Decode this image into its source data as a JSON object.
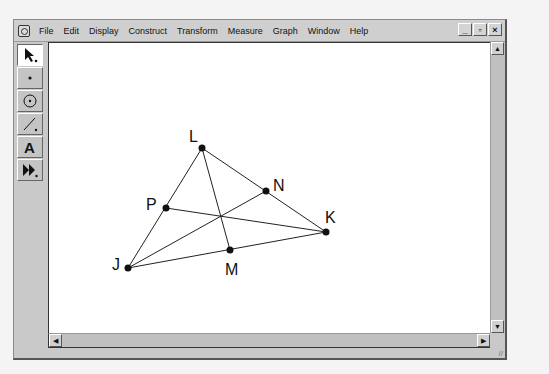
{
  "window": {
    "menu": [
      "File",
      "Edit",
      "Display",
      "Construct",
      "Transform",
      "Measure",
      "Graph",
      "Window",
      "Help"
    ],
    "controls": {
      "minimize": "_",
      "restore": "▫",
      "close": "×"
    }
  },
  "toolbox": {
    "tools": [
      {
        "name": "selection-arrow-tool",
        "glyph": "↖",
        "active": true
      },
      {
        "name": "point-tool",
        "glyph": "•",
        "active": false
      },
      {
        "name": "compass-tool",
        "glyph": "⊙",
        "active": false
      },
      {
        "name": "straightedge-tool",
        "glyph": "/",
        "active": false
      },
      {
        "name": "text-tool",
        "glyph": "A",
        "active": false
      },
      {
        "name": "custom-tool",
        "glyph": "▶▶",
        "active": false
      }
    ]
  },
  "sketch": {
    "points": [
      {
        "label": "L",
        "x": 153,
        "y": 105
      },
      {
        "label": "N",
        "x": 217,
        "y": 148
      },
      {
        "label": "P",
        "x": 117,
        "y": 165
      },
      {
        "label": "K",
        "x": 277,
        "y": 189
      },
      {
        "label": "M",
        "x": 181,
        "y": 207
      },
      {
        "label": "J",
        "x": 79,
        "y": 225
      }
    ]
  },
  "scrollbars": {
    "up": "▲",
    "down": "▼",
    "left": "◀",
    "right": "▶"
  }
}
